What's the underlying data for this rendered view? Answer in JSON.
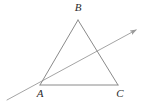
{
  "figure": {
    "background_color": "#ffffff",
    "stroke_color": "#8a8a8a",
    "ray_color": "#9a9a9a",
    "label_color": "#2b2b2b",
    "stroke_width": 1,
    "canvas": {
      "width": 144,
      "height": 105
    }
  },
  "labels": {
    "a": "A",
    "b": "B",
    "c": "C"
  },
  "chart_data": {
    "type": "diagram",
    "points": [
      {
        "name": "A",
        "x": 40,
        "y": 85,
        "label": "A",
        "label_x": 40,
        "label_y": 97
      },
      {
        "name": "B",
        "x": 78,
        "y": 20,
        "label": "B",
        "label_x": 78,
        "label_y": 11
      },
      {
        "name": "C",
        "x": 118,
        "y": 85,
        "label": "C",
        "label_x": 120,
        "label_y": 97
      }
    ],
    "segments": [
      {
        "name": "AB",
        "from": "A",
        "to": "B",
        "x1": 40,
        "y1": 85,
        "x2": 78,
        "y2": 20
      },
      {
        "name": "BC",
        "from": "B",
        "to": "C",
        "x1": 78,
        "y1": 20,
        "x2": 118,
        "y2": 85
      },
      {
        "name": "AC",
        "from": "A",
        "to": "C",
        "x1": 40,
        "y1": 85,
        "x2": 118,
        "y2": 85
      }
    ],
    "rays": [
      {
        "name": "ray-through-A",
        "x1": 7,
        "y1": 100,
        "x2": 136,
        "y2": 30,
        "arrow_at_end": true,
        "arrow_at_start": false,
        "passes_through": [
          "A"
        ],
        "crosses": [
          "BC"
        ],
        "crossing_point": {
          "x": 101,
          "y": 52
        }
      }
    ],
    "xlabel": "",
    "ylabel": "",
    "grid": false,
    "legend": false
  }
}
